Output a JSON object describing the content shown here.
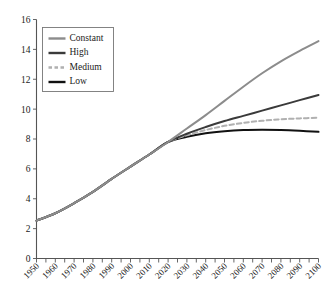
{
  "chart_data": {
    "type": "line",
    "title": "",
    "xlabel": "",
    "ylabel": "",
    "xlim": [
      1950,
      2100
    ],
    "ylim": [
      0,
      16
    ],
    "grid": false,
    "legend_position": "top-left",
    "yticks": [
      0,
      2,
      4,
      6,
      8,
      10,
      12,
      14,
      16
    ],
    "xticks": [
      1950,
      1960,
      1970,
      1980,
      1990,
      2000,
      2010,
      2020,
      2030,
      2040,
      2050,
      2060,
      2070,
      2080,
      2090,
      2100
    ],
    "minor_xtick_step": 5,
    "x": [
      1950,
      1960,
      1970,
      1980,
      1990,
      2000,
      2010,
      2020,
      2030,
      2040,
      2050,
      2060,
      2070,
      2080,
      2090,
      2100
    ],
    "series": [
      {
        "name": "Constant",
        "color": "#8c8c8c",
        "style": "solid",
        "width": 2.0,
        "values": [
          2.54,
          3.03,
          3.7,
          4.46,
          5.33,
          6.15,
          6.96,
          7.8,
          8.8,
          9.95,
          11.2,
          12.55,
          14.0,
          15.6,
          17.4,
          19.5
        ],
        "values_plotted": [
          2.54,
          3.03,
          3.7,
          4.46,
          5.33,
          6.15,
          6.96,
          7.8,
          8.7,
          9.6,
          10.55,
          11.5,
          12.4,
          13.2,
          13.9,
          14.55
        ]
      },
      {
        "name": "High",
        "color": "#3a3a3a",
        "style": "solid",
        "width": 2.0,
        "values": [
          2.54,
          3.03,
          3.7,
          4.46,
          5.33,
          6.15,
          6.96,
          7.8,
          8.6,
          9.3,
          10.0,
          10.6,
          11.2,
          11.7,
          12.2,
          12.7
        ],
        "values_plotted": [
          2.54,
          3.03,
          3.7,
          4.46,
          5.33,
          6.15,
          6.96,
          7.8,
          8.35,
          8.8,
          9.2,
          9.55,
          9.9,
          10.25,
          10.6,
          10.95
        ]
      },
      {
        "name": "Medium",
        "color": "#b0b0b0",
        "style": "dashed",
        "width": 2.0,
        "values": [
          2.54,
          3.03,
          3.7,
          4.46,
          5.33,
          6.15,
          6.96,
          7.8,
          8.55,
          9.2,
          9.75,
          10.15,
          10.45,
          10.65,
          10.8,
          10.9
        ],
        "values_plotted": [
          2.54,
          3.03,
          3.7,
          4.46,
          5.33,
          6.15,
          6.96,
          7.8,
          8.25,
          8.6,
          8.88,
          9.08,
          9.22,
          9.32,
          9.38,
          9.42
        ]
      },
      {
        "name": "Low",
        "color": "#111111",
        "style": "solid",
        "width": 2.0,
        "values": [
          2.54,
          3.03,
          3.7,
          4.46,
          5.33,
          6.15,
          6.96,
          7.8,
          8.45,
          8.9,
          9.1,
          9.05,
          8.8,
          8.4,
          7.9,
          7.3
        ],
        "values_plotted": [
          2.54,
          3.03,
          3.7,
          4.46,
          5.33,
          6.15,
          6.96,
          7.8,
          8.15,
          8.38,
          8.52,
          8.6,
          8.62,
          8.6,
          8.55,
          8.48
        ]
      }
    ]
  },
  "axes": {
    "ytick_labels": [
      "0",
      "2",
      "4",
      "6",
      "8",
      "10",
      "12",
      "14",
      "16"
    ],
    "xtick_labels": [
      "1950",
      "1960",
      "1970",
      "1980",
      "1990",
      "2000",
      "2010",
      "2020",
      "2030",
      "2040",
      "2050",
      "2060",
      "2070",
      "2080",
      "2090",
      "2100"
    ]
  },
  "legend": {
    "items": [
      {
        "label": "Constant"
      },
      {
        "label": "High"
      },
      {
        "label": "Medium"
      },
      {
        "label": "Low"
      }
    ]
  }
}
